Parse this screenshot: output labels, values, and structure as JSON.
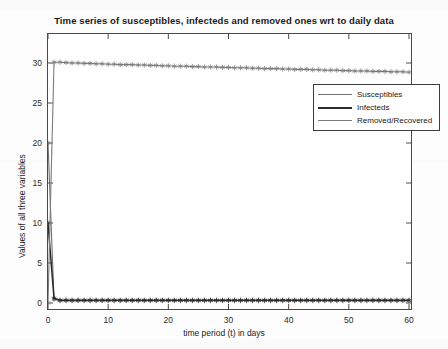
{
  "chart_data": {
    "type": "line",
    "title": "Time series of susceptibles, infecteds and removed ones wrt to daily data",
    "xlabel": "time period (t) in days",
    "ylabel": "Values of all three variables",
    "xlim": [
      0,
      60
    ],
    "ylim": [
      0,
      32
    ],
    "xticks": [
      0,
      10,
      20,
      30,
      40,
      50,
      60
    ],
    "yticks": [
      0,
      5,
      10,
      15,
      20,
      25,
      30
    ],
    "grid": false,
    "legend_position": "upper-right-inside",
    "x": [
      0,
      1,
      2,
      3,
      4,
      5,
      6,
      7,
      8,
      9,
      10,
      11,
      12,
      13,
      14,
      15,
      16,
      17,
      18,
      19,
      20,
      21,
      22,
      23,
      24,
      25,
      26,
      27,
      28,
      29,
      30,
      31,
      32,
      33,
      34,
      35,
      36,
      37,
      38,
      39,
      40,
      41,
      42,
      43,
      44,
      45,
      46,
      47,
      48,
      49,
      50,
      51,
      52,
      53,
      54,
      55,
      56,
      57,
      58,
      59,
      60
    ],
    "series": [
      {
        "name": "Susceptibles",
        "color": "#6f6f6f",
        "marker": "star",
        "values": [
          20.0,
          0.45,
          0.3,
          0.3,
          0.3,
          0.3,
          0.3,
          0.3,
          0.3,
          0.3,
          0.3,
          0.3,
          0.3,
          0.3,
          0.3,
          0.3,
          0.3,
          0.3,
          0.3,
          0.3,
          0.3,
          0.3,
          0.3,
          0.3,
          0.3,
          0.3,
          0.3,
          0.3,
          0.3,
          0.3,
          0.3,
          0.3,
          0.3,
          0.3,
          0.3,
          0.3,
          0.3,
          0.3,
          0.3,
          0.3,
          0.3,
          0.3,
          0.3,
          0.3,
          0.3,
          0.3,
          0.3,
          0.3,
          0.3,
          0.3,
          0.3,
          0.3,
          0.3,
          0.3,
          0.3,
          0.3,
          0.3,
          0.3,
          0.3,
          0.3,
          0.3
        ]
      },
      {
        "name": "Infecteds",
        "color": "#2b2b2b",
        "marker": "star",
        "values": [
          10.0,
          0.6,
          0.35,
          0.35,
          0.35,
          0.35,
          0.35,
          0.35,
          0.35,
          0.35,
          0.35,
          0.35,
          0.35,
          0.35,
          0.35,
          0.35,
          0.35,
          0.35,
          0.35,
          0.35,
          0.35,
          0.35,
          0.35,
          0.35,
          0.35,
          0.35,
          0.35,
          0.35,
          0.35,
          0.35,
          0.35,
          0.35,
          0.35,
          0.35,
          0.35,
          0.35,
          0.35,
          0.35,
          0.35,
          0.35,
          0.35,
          0.35,
          0.35,
          0.35,
          0.35,
          0.35,
          0.35,
          0.35,
          0.35,
          0.35,
          0.35,
          0.35,
          0.35,
          0.35,
          0.35,
          0.35,
          0.35,
          0.35,
          0.35,
          0.35,
          0.35
        ]
      },
      {
        "name": "Removed/Recovered",
        "color": "#7a7a7a",
        "marker": "star",
        "values": [
          0.0,
          30.1,
          30.1,
          30.05,
          30.0,
          30.0,
          29.95,
          29.95,
          29.9,
          29.9,
          29.85,
          29.85,
          29.8,
          29.8,
          29.8,
          29.75,
          29.75,
          29.7,
          29.7,
          29.65,
          29.65,
          29.6,
          29.6,
          29.6,
          29.55,
          29.55,
          29.5,
          29.5,
          29.5,
          29.45,
          29.45,
          29.4,
          29.4,
          29.4,
          29.35,
          29.35,
          29.3,
          29.3,
          29.3,
          29.25,
          29.25,
          29.2,
          29.2,
          29.2,
          29.15,
          29.15,
          29.1,
          29.1,
          29.1,
          29.05,
          29.05,
          29.0,
          29.0,
          29.0,
          28.95,
          28.95,
          28.95,
          28.9,
          28.9,
          28.9,
          28.85
        ]
      }
    ]
  },
  "legend": {
    "items": [
      {
        "label": "Susceptibles"
      },
      {
        "label": "Infecteds"
      },
      {
        "label": "Removed/Recovered"
      }
    ]
  },
  "axis": {
    "y_labels": [
      "30",
      "25",
      "20",
      "15",
      "10",
      "5",
      "0"
    ],
    "x_labels": [
      "0",
      "10",
      "20",
      "30",
      "40",
      "50",
      "60"
    ]
  }
}
